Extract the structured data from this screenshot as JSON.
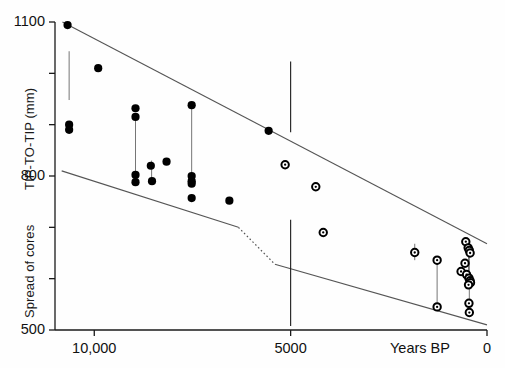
{
  "chart_data": {
    "type": "scatter",
    "title": "",
    "xlabel": "Years BP",
    "ylabel_upper": "TIP-TO-TIP (mm)",
    "ylabel_lower": "Spread of cores",
    "xlim": [
      11000,
      0
    ],
    "ylim": [
      500,
      1100
    ],
    "x_reversed": true,
    "grid": false,
    "legend": null,
    "x_ticks": [
      {
        "value": 10000,
        "label": "10,000"
      },
      {
        "value": 5000,
        "label": "5000"
      },
      {
        "value": 0,
        "label": "0"
      }
    ],
    "y_ticks": [
      {
        "value": 1100,
        "label": "1100"
      },
      {
        "value": 1000,
        "label": ""
      },
      {
        "value": 900,
        "label": ""
      },
      {
        "value": 800,
        "label": "800"
      },
      {
        "value": 700,
        "label": ""
      },
      {
        "value": 600,
        "label": ""
      },
      {
        "value": 500,
        "label": "500"
      }
    ],
    "series": [
      {
        "name": "filled-points",
        "marker": "filled-circle",
        "color": "#000000",
        "points": [
          {
            "x": 10680,
            "y": 1094
          },
          {
            "x": 10640,
            "y": 900
          },
          {
            "x": 10640,
            "y": 890
          },
          {
            "x": 9900,
            "y": 1010
          },
          {
            "x": 8950,
            "y": 932
          },
          {
            "x": 8950,
            "y": 915
          },
          {
            "x": 8950,
            "y": 802
          },
          {
            "x": 8950,
            "y": 788
          },
          {
            "x": 8560,
            "y": 820
          },
          {
            "x": 8530,
            "y": 790
          },
          {
            "x": 8160,
            "y": 828
          },
          {
            "x": 7520,
            "y": 938
          },
          {
            "x": 7520,
            "y": 800
          },
          {
            "x": 7520,
            "y": 790
          },
          {
            "x": 7520,
            "y": 785
          },
          {
            "x": 7520,
            "y": 757
          },
          {
            "x": 6560,
            "y": 752
          },
          {
            "x": 5560,
            "y": 888
          }
        ]
      },
      {
        "name": "open-points",
        "marker": "open-circle",
        "color": "#000000",
        "points": [
          {
            "x": 5140,
            "y": 822
          },
          {
            "x": 4360,
            "y": 779
          },
          {
            "x": 4170,
            "y": 690
          },
          {
            "x": 1840,
            "y": 651
          },
          {
            "x": 1270,
            "y": 636
          },
          {
            "x": 1270,
            "y": 545
          },
          {
            "x": 540,
            "y": 672
          },
          {
            "x": 480,
            "y": 660
          },
          {
            "x": 450,
            "y": 655
          },
          {
            "x": 430,
            "y": 650
          },
          {
            "x": 560,
            "y": 630
          },
          {
            "x": 660,
            "y": 614
          },
          {
            "x": 520,
            "y": 608
          },
          {
            "x": 460,
            "y": 601
          },
          {
            "x": 430,
            "y": 596
          },
          {
            "x": 420,
            "y": 592
          },
          {
            "x": 470,
            "y": 588
          },
          {
            "x": 460,
            "y": 552
          },
          {
            "x": 450,
            "y": 534
          }
        ]
      }
    ],
    "error_bars": [
      {
        "x": 10640,
        "y_low": 948,
        "y_high": 1043
      },
      {
        "x": 8950,
        "y_low": 805,
        "y_high": 912
      },
      {
        "x": 8540,
        "y_low": 792,
        "y_high": 830
      },
      {
        "x": 7520,
        "y_low": 800,
        "y_high": 932
      },
      {
        "x": 1840,
        "y_low": 636,
        "y_high": 668
      },
      {
        "x": 1270,
        "y_low": 548,
        "y_high": 632
      },
      {
        "x": 450,
        "y_low": 556,
        "y_high": 650
      },
      {
        "x": 470,
        "y_low": 594,
        "y_high": 652
      }
    ],
    "envelope_upper": [
      {
        "x": 10810,
        "y": 1100
      },
      {
        "x": 0,
        "y": 668
      }
    ],
    "envelope_lower_solid_left": [
      {
        "x": 10830,
        "y": 810
      },
      {
        "x": 6330,
        "y": 700
      }
    ],
    "envelope_lower_dotted": [
      {
        "x": 6330,
        "y": 700
      },
      {
        "x": 5400,
        "y": 628
      }
    ],
    "envelope_lower_solid_right": [
      {
        "x": 5400,
        "y": 628
      },
      {
        "x": 0,
        "y": 510
      }
    ],
    "reference_lines": [
      {
        "name": "vertical-5000-upper",
        "x": 5000,
        "y_low": 885,
        "y_high": 1023
      },
      {
        "name": "vertical-5000-lower",
        "x": 5000,
        "y_low": 508,
        "y_high": 715
      }
    ]
  },
  "axes": {
    "x_axis_label": "Years BP",
    "y_upper_label": "TIP-TO-TIP (mm)",
    "y_lower_label": "Spread of cores",
    "tick_1100": "1100",
    "tick_800": "800",
    "tick_500": "500",
    "tick_10000": "10,000",
    "tick_5000": "5000",
    "tick_0": "0"
  },
  "colors": {
    "axis": "#1a1a1a",
    "marker": "#000000",
    "envelope": "#555555"
  }
}
